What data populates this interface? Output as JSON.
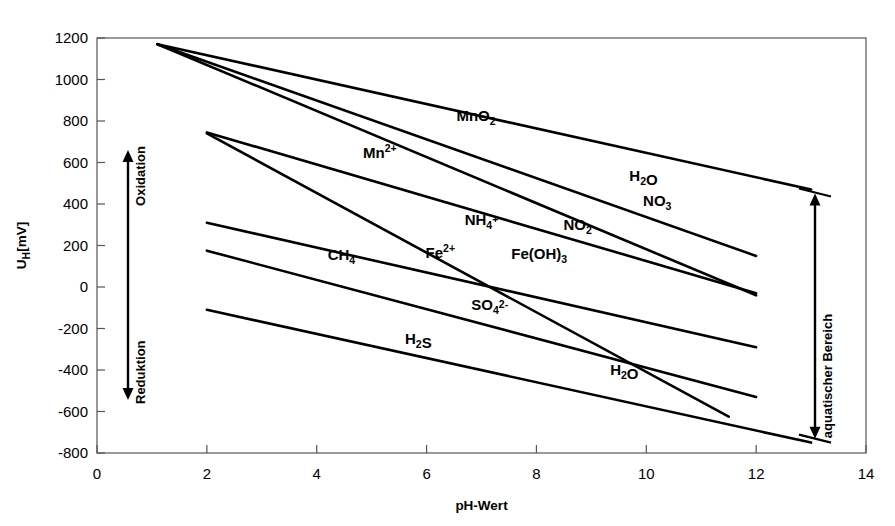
{
  "figure": {
    "title_fragment": "",
    "background": "#ffffff",
    "line_color": "#000000",
    "axis_color": "#555555"
  },
  "chart_data": {
    "type": "line",
    "title": "",
    "xlabel": "pH-Wert",
    "ylabel": "U_H[mV]",
    "ylabel_parts": {
      "main": "U",
      "sub": "H",
      "unit": "[mV]"
    },
    "xlim": [
      0,
      14
    ],
    "ylim": [
      -800,
      1200
    ],
    "xticks": [
      0,
      2,
      4,
      6,
      8,
      10,
      12,
      14
    ],
    "xtick_labels": [
      "0",
      "2",
      "4",
      "6",
      "8",
      "10",
      "12",
      "14"
    ],
    "yticks": [
      -800,
      -600,
      -400,
      -200,
      0,
      200,
      400,
      600,
      800,
      1000,
      1200
    ],
    "ytick_labels": [
      "-800",
      "-600",
      "-400",
      "-200",
      "0",
      "200",
      "400",
      "600",
      "800",
      "1000",
      "1200"
    ],
    "grid": false,
    "legend": "none",
    "series": [
      {
        "name": "H2O-upper-stability",
        "points": [
          [
            1.1,
            1170
          ],
          [
            13.0,
            470
          ]
        ]
      },
      {
        "name": "MnO2/Mn2+ boundary",
        "points": [
          [
            1.1,
            1170
          ],
          [
            12.0,
            150
          ]
        ]
      },
      {
        "name": "NO3/NO2 steep boundary",
        "points": [
          [
            1.1,
            1170
          ],
          [
            12.0,
            -40
          ]
        ]
      },
      {
        "name": "Fe(OH)3/Fe2+ boundary",
        "points": [
          [
            2.0,
            745
          ],
          [
            12.0,
            -30
          ]
        ]
      },
      {
        "name": "NH4+/NO2 boundary",
        "points": [
          [
            2.0,
            740
          ],
          [
            11.5,
            -625
          ]
        ]
      },
      {
        "name": "CH4 boundary",
        "points": [
          [
            2.0,
            310
          ],
          [
            12.0,
            -290
          ]
        ]
      },
      {
        "name": "SO42-/H2S boundary",
        "points": [
          [
            2.0,
            175
          ],
          [
            12.0,
            -530
          ]
        ]
      },
      {
        "name": "H2O-lower-stability",
        "points": [
          [
            2.0,
            -110
          ],
          [
            13.0,
            -750
          ]
        ]
      }
    ],
    "species_labels": [
      {
        "id": "mno2",
        "text": "MnO2",
        "base": "MnO",
        "sub": "2",
        "sup": "",
        "x": 6.9,
        "y": 800
      },
      {
        "id": "mn2",
        "text": "Mn2+",
        "base": "Mn",
        "sub": "",
        "sup": "2+",
        "x": 5.15,
        "y": 620
      },
      {
        "id": "h2o_up",
        "text": "H2O",
        "base": "H",
        "sub": "2",
        "sup": "",
        "tail": "O",
        "x": 9.95,
        "y": 510
      },
      {
        "id": "no3",
        "text": "NO3",
        "base": "NO",
        "sub": "3",
        "sup": "",
        "x": 10.2,
        "y": 390
      },
      {
        "id": "no2",
        "text": "NO2",
        "base": "NO",
        "sub": "2",
        "sup": "",
        "x": 8.75,
        "y": 275
      },
      {
        "id": "nh4",
        "text": "NH4+",
        "base": "NH",
        "sub": "4",
        "sup": "+",
        "x": 7.0,
        "y": 300
      },
      {
        "id": "feoh3",
        "text": "Fe(OH)3",
        "base": "Fe(OH)",
        "sub": "3",
        "sup": "",
        "x": 8.05,
        "y": 135
      },
      {
        "id": "fe2",
        "text": "Fe2+",
        "base": "Fe",
        "sub": "",
        "sup": "2+",
        "x": 6.25,
        "y": 140
      },
      {
        "id": "ch4",
        "text": "CH4",
        "base": "CH",
        "sub": "4",
        "sup": "",
        "x": 4.45,
        "y": 130
      },
      {
        "id": "so4",
        "text": "SO42-",
        "base": "SO",
        "sub": "4",
        "sup": "2-",
        "x": 7.15,
        "y": -110
      },
      {
        "id": "h2s",
        "text": "H2S",
        "base": "H",
        "sub": "2",
        "sup": "",
        "tail": "S",
        "x": 5.85,
        "y": -275
      },
      {
        "id": "h2o_lo",
        "text": "H2O",
        "base": "H",
        "sub": "2",
        "sup": "",
        "tail": "O",
        "x": 9.6,
        "y": -425
      }
    ],
    "annotations": [
      {
        "id": "oxidation",
        "text": "Oxidation",
        "orientation": "vertical",
        "side": "left"
      },
      {
        "id": "reduktion",
        "text": "Reduktion",
        "orientation": "vertical",
        "side": "left"
      },
      {
        "id": "aquatisch",
        "text": "aquatischer Bereich",
        "orientation": "vertical",
        "side": "right"
      }
    ]
  }
}
